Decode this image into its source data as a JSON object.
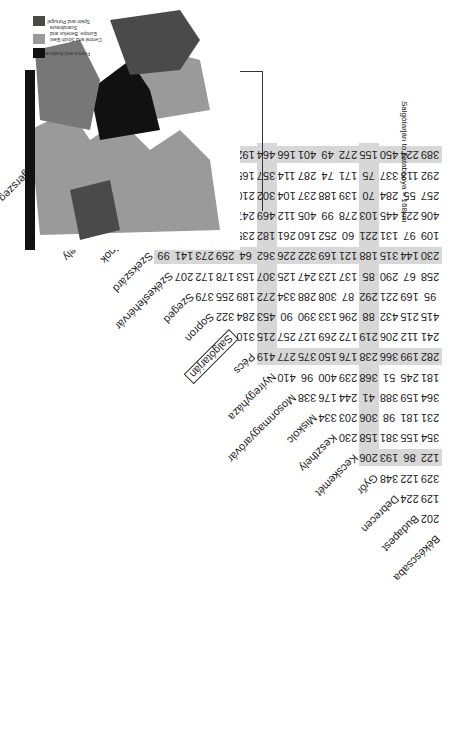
{
  "orientation": "rotated-180",
  "chart_data": {
    "type": "table",
    "note": "Salgótarján to Tatabánya = 168km",
    "highlight": {
      "from": "Salgótarján",
      "to": "Tatabánya",
      "value": 168
    },
    "cities": [
      "Békéscsaba",
      "Budapest",
      "Debrecen",
      "Győr",
      "Kecskemét",
      "Keszthely",
      "Miskolc",
      "Mosonmagyaróvár",
      "Nyíregyháza",
      "Pécs",
      "Salgótarján",
      "Sopron",
      "Szeged",
      "Székesfehérvár",
      "Szekszárd",
      "Szolnok",
      "Szombathely",
      "Tatabánya",
      "Veszprém",
      "Zalaegerszeg"
    ],
    "rows": [
      {
        "city": "Budapest",
        "values": [
          202
        ]
      },
      {
        "city": "Debrecen",
        "values": [
          129,
          224
        ]
      },
      {
        "city": "Győr",
        "values": [
          329,
          122,
          348
        ]
      },
      {
        "city": "Kecskemét",
        "values": [
          122,
          86,
          193,
          206
        ]
      },
      {
        "city": "Keszthely",
        "values": [
          354,
          155,
          381,
          158,
          230
        ]
      },
      {
        "city": "Miskolc",
        "values": [
          231,
          181,
          98,
          306,
          203,
          334
        ]
      },
      {
        "city": "Mosonmagyaróvár",
        "values": [
          364,
          159,
          388,
          41,
          244,
          176,
          338
        ]
      },
      {
        "city": "Nyíregyháza",
        "values": [
          181,
          245,
          51,
          368,
          239,
          400,
          96,
          410
        ]
      },
      {
        "city": "Pécs",
        "values": [
          282,
          199,
          366,
          238,
          176,
          150,
          375,
          277,
          419
        ]
      },
      {
        "city": "Salgótarján",
        "values": [
          241,
          112,
          206,
          219,
          172,
          269,
          127,
          257,
          215,
          310
        ]
      },
      {
        "city": "Sopron",
        "values": [
          415,
          215,
          432,
          88,
          296,
          133,
          390,
          90,
          453,
          284,
          322
        ]
      },
      {
        "city": "Szeged",
        "values": [
          95,
          169,
          221,
          292,
          87,
          308,
          288,
          334,
          272,
          189,
          255,
          379
        ]
      },
      {
        "city": "Székesfehérvár",
        "values": [
          258,
          67,
          290,
          85,
          137,
          123,
          247,
          125,
          307,
          153,
          178,
          172,
          207
        ]
      },
      {
        "city": "Szekszárd",
        "values": [
          230,
          144,
          315,
          188,
          121,
          169,
          322,
          226,
          362,
          64,
          259,
          273,
          141,
          99
        ]
      },
      {
        "city": "Szolnok",
        "values": [
          109,
          97,
          131,
          221,
          60,
          252,
          160,
          261,
          182,
          235,
          132,
          309,
          132,
          161,
          186
        ]
      },
      {
        "city": "Szombathely",
        "values": [
          406,
          221,
          445,
          103,
          278,
          99,
          405,
          112,
          469,
          247,
          334,
          71,
          354,
          155,
          241,
          320
        ]
      },
      {
        "city": "Tatabánya",
        "values": [
          257,
          55,
          284,
          70,
          139,
          188,
          237,
          104,
          302,
          210,
          168,
          155,
          227,
          59,
          159,
          155,
          174
        ]
      },
      {
        "city": "Veszprém",
        "values": [
          292,
          113,
          337,
          75,
          171,
          74,
          287,
          114,
          357,
          165,
          226,
          144,
          240,
          45,
          129,
          210,
          113,
          103
        ]
      },
      {
        "city": "Zalaegerszeg",
        "values": [
          389,
          224,
          450,
          155,
          272,
          49,
          401,
          166,
          464,
          192,
          338,
          126,
          345,
          164,
          210,
          322,
          54,
          221,
          121
        ]
      }
    ],
    "shaded_rows": [
      "Kecskemét",
      "Pécs",
      "Szekszárd",
      "Zalaegerszeg"
    ],
    "shaded_columns": [
      "Győr",
      "Nyíregyháza",
      "Székesfehérvár",
      "Szombathely"
    ]
  },
  "map": {
    "legend": [
      {
        "label": "France and Andorra",
        "color": "#111111"
      },
      {
        "label": "Central and South East Europe, Benelux and Scandinavia",
        "color": "#9a9a9a"
      },
      {
        "label": "Spain and Portugal",
        "color": "#4a4a4a"
      }
    ]
  }
}
